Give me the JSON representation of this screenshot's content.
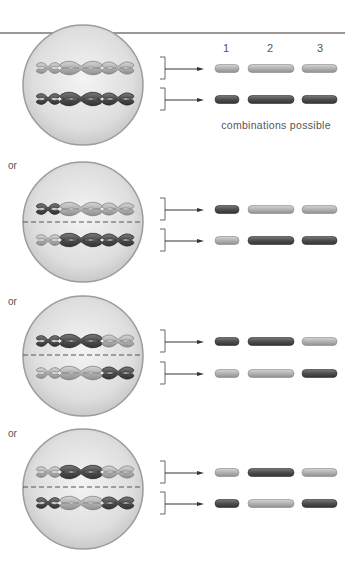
{
  "header": {
    "column_labels": [
      "1",
      "2",
      "3"
    ],
    "caption": "combinations possible"
  },
  "separator_text": "or",
  "colors": {
    "light": "#b5b5b5",
    "dark": "#5a5a5a",
    "cell_fill": "#e6e6e6",
    "cell_stroke": "#a8a8a8"
  },
  "arrangements": [
    {
      "id": 1,
      "top": [
        "L",
        "L",
        "L"
      ],
      "bottom": [
        "D",
        "D",
        "D"
      ],
      "divider": false
    },
    {
      "id": 2,
      "top": [
        "D",
        "L",
        "L"
      ],
      "bottom": [
        "L",
        "D",
        "D"
      ],
      "divider": true
    },
    {
      "id": 3,
      "top": [
        "D",
        "D",
        "L"
      ],
      "bottom": [
        "L",
        "L",
        "D"
      ],
      "divider": true
    },
    {
      "id": 4,
      "top": [
        "L",
        "D",
        "L"
      ],
      "bottom": [
        "D",
        "L",
        "D"
      ],
      "divider": true
    }
  ]
}
